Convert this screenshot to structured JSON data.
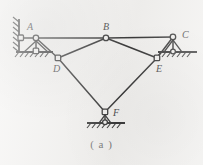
{
  "figure": {
    "caption": "( a )",
    "kind": "planar-truss-mechanism-diagram",
    "background_color": "#f2f1ef",
    "line_color": "#3a3a3a",
    "label_color": "#4c4c4c",
    "caption_color": "#7b7b7b",
    "width": 203,
    "height": 165
  },
  "joints": [
    {
      "id": "A",
      "label": "A",
      "x": 36,
      "y": 38,
      "label_x": 27,
      "label_y": 22,
      "type": "pin"
    },
    {
      "id": "B",
      "label": "B",
      "x": 106,
      "y": 38,
      "label_x": 103,
      "label_y": 22,
      "type": "pin"
    },
    {
      "id": "C",
      "label": "C",
      "x": 173,
      "y": 37,
      "label_x": 182,
      "label_y": 30,
      "type": "pin"
    },
    {
      "id": "D",
      "label": "D",
      "x": 58,
      "y": 58,
      "label_x": 53,
      "label_y": 64,
      "type": "pin"
    },
    {
      "id": "E",
      "label": "E",
      "x": 157,
      "y": 58,
      "label_x": 156,
      "label_y": 64,
      "type": "pin"
    },
    {
      "id": "F",
      "label": "F",
      "x": 105,
      "y": 112,
      "label_x": 112,
      "label_y": 109,
      "type": "pin"
    },
    {
      "id": "G",
      "label": "",
      "x": 21,
      "y": 38,
      "label_x": 0,
      "label_y": 0,
      "type": "wall-pin"
    },
    {
      "id": "H",
      "label": "",
      "x": 36,
      "y": 52,
      "label_x": 0,
      "label_y": 0,
      "type": "ground-pin"
    }
  ],
  "members": [
    {
      "from": "G",
      "to": "A",
      "name": "member-wall-A"
    },
    {
      "from": "A",
      "to": "H",
      "name": "member-A-ground"
    },
    {
      "from": "A",
      "to": "B",
      "name": "member-A-B"
    },
    {
      "from": "B",
      "to": "C",
      "name": "member-B-C"
    },
    {
      "from": "A",
      "to": "D",
      "name": "member-A-D"
    },
    {
      "from": "D",
      "to": "B",
      "name": "member-D-B"
    },
    {
      "from": "B",
      "to": "E",
      "name": "member-B-E"
    },
    {
      "from": "E",
      "to": "C",
      "name": "member-E-C"
    },
    {
      "from": "D",
      "to": "F",
      "name": "member-D-F"
    },
    {
      "from": "F",
      "to": "E",
      "name": "member-F-E"
    }
  ],
  "supports": [
    {
      "id": "wall-left",
      "name": "wall-support-left",
      "type": "vertical-hatched-wall",
      "x": 18,
      "y_top": 20,
      "y_bottom": 52
    },
    {
      "id": "ground-A",
      "name": "ground-support-under-A",
      "type": "hatched-ground",
      "x_left": 16,
      "x_right": 52,
      "y": 52
    },
    {
      "id": "ground-C",
      "name": "ground-support-under-C",
      "type": "hatched-ground",
      "x_left": 160,
      "x_right": 196,
      "y": 52
    },
    {
      "id": "ground-F",
      "name": "ground-support-under-F",
      "type": "hatched-ground",
      "x_left": 88,
      "x_right": 124,
      "y": 123
    }
  ]
}
